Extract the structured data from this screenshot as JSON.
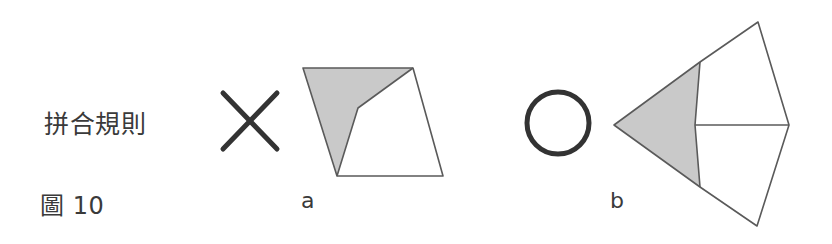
{
  "figure": {
    "background_color": "#ffffff",
    "width": 832,
    "height": 244,
    "caption_rule": "拼合規則",
    "caption_figure": "圖 10"
  },
  "panels": [
    {
      "id": "a",
      "letter": "a"
    },
    {
      "id": "b",
      "letter": "b"
    }
  ],
  "colors": {
    "shaded_fill": "#c9c9c9",
    "white_fill": "#ffffff",
    "outline": "#5a5a5a",
    "mark_stroke": "#333333",
    "text": "#3a3a3a"
  },
  "diagram": {
    "cross_mark": {
      "name": "x-mark",
      "stroke_width": 5,
      "strokes": [
        {
          "x1": 223,
          "y1": 93,
          "x2": 277,
          "y2": 149
        },
        {
          "x1": 277,
          "y1": 93,
          "x2": 223,
          "y2": 149
        }
      ]
    },
    "circle_mark": {
      "name": "circle-mark",
      "cx": 558,
      "cy": 123,
      "r": 31,
      "stroke_width": 5
    },
    "shape_a": {
      "name": "quadrilateral-tile-a",
      "outline": "303,68 413,68 443,176 337,176",
      "shaded_region": "303,68 413,68 358,108 337,176",
      "white_region": "413,68 443,176 337,176 358,108",
      "interior_edges": [
        {
          "x1": 413,
          "y1": 68,
          "x2": 358,
          "y2": 108
        },
        {
          "x1": 358,
          "y1": 108,
          "x2": 337,
          "y2": 176
        }
      ]
    },
    "shape_b": {
      "name": "arrowhead-tile-b",
      "outline": "758,22 789,125 757,226 700,187 614,125 700,62",
      "shaded_region": "700,62 695,125 700,187 614,125",
      "white_region_upper": "700,62 758,22 789,125 695,125",
      "white_region_lower": "695,125 789,125 757,226 700,187",
      "interior_edges": [
        {
          "x1": 700,
          "y1": 62,
          "x2": 695,
          "y2": 125
        },
        {
          "x1": 695,
          "y1": 125,
          "x2": 700,
          "y2": 187
        },
        {
          "x1": 695,
          "y1": 125,
          "x2": 789,
          "y2": 125
        }
      ]
    }
  }
}
